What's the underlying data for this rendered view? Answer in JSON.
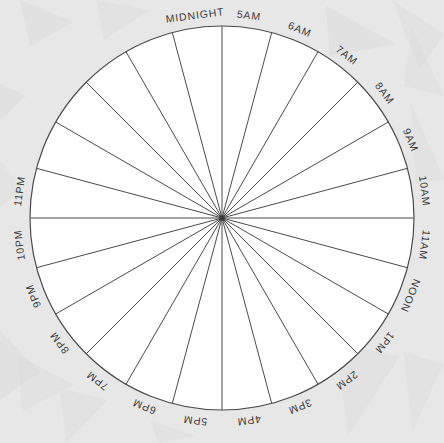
{
  "diagram": {
    "type": "radial-sector-wheel",
    "sector_count": 24,
    "degrees_per_sector": 15,
    "center": {
      "x": 222,
      "y": 218
    },
    "radius": 192,
    "colors": {
      "background": "#e7e7e7",
      "background_shapes": "#dcdcdc",
      "wheel_fill": "#ffffff",
      "stroke": "#4a4a4a",
      "label_text": "#3b3b3b"
    },
    "labels": [
      {
        "text": "MIDNIGHT",
        "angle_deg": -97.5
      },
      {
        "text": "5AM",
        "angle_deg": -82.5
      },
      {
        "text": "6AM",
        "angle_deg": -67.5
      },
      {
        "text": "7AM",
        "angle_deg": -52.5
      },
      {
        "text": "8AM",
        "angle_deg": -37.5
      },
      {
        "text": "9AM",
        "angle_deg": -22.5
      },
      {
        "text": "10AM",
        "angle_deg": -7.5
      },
      {
        "text": "11AM",
        "angle_deg": 7.5
      },
      {
        "text": "NOON",
        "angle_deg": 22.5
      },
      {
        "text": "1PM",
        "angle_deg": 37.5
      },
      {
        "text": "2PM",
        "angle_deg": 52.5
      },
      {
        "text": "3PM",
        "angle_deg": 67.5
      },
      {
        "text": "4PM",
        "angle_deg": 82.5
      },
      {
        "text": "5PM",
        "angle_deg": 97.5
      },
      {
        "text": "6PM",
        "angle_deg": 112.5
      },
      {
        "text": "7PM",
        "angle_deg": 127.5
      },
      {
        "text": "8PM",
        "angle_deg": 142.5
      },
      {
        "text": "9PM",
        "angle_deg": 157.5
      },
      {
        "text": "10PM",
        "angle_deg": 172.5
      },
      {
        "text": "11PM",
        "angle_deg": 187.5
      }
    ],
    "spokes_deg": [
      -90,
      -75,
      -60,
      -45,
      -30,
      -15,
      0,
      15,
      30,
      45,
      60,
      75,
      90,
      105,
      120,
      135,
      150,
      165,
      180,
      195,
      210,
      225,
      240,
      255
    ],
    "background_shapes": [
      {
        "points": "20,0 74,22 30,46",
        "opacity": 0.55
      },
      {
        "points": "96,0 150,10 104,40",
        "opacity": 0.45
      },
      {
        "points": "0,84 26,96 0,120",
        "opacity": 0.5
      },
      {
        "points": "326,6 396,44 330,56",
        "opacity": 0.5
      },
      {
        "points": "392,0 444,34 420,70",
        "opacity": 0.45
      },
      {
        "points": "412,28 444,96 404,86",
        "opacity": 0.4
      },
      {
        "points": "410,100 444,180 416,182",
        "opacity": 0.45
      },
      {
        "points": "0,330 40,372 0,400",
        "opacity": 0.5
      },
      {
        "points": "18,356 74,384 22,412",
        "opacity": 0.45
      },
      {
        "points": "60,388 108,400 66,443",
        "opacity": 0.4
      },
      {
        "points": "282,336 330,352 290,392",
        "opacity": 0.5
      },
      {
        "points": "336,344 400,356 348,436",
        "opacity": 0.45
      },
      {
        "points": "404,352 444,364 412,432",
        "opacity": 0.4
      },
      {
        "points": "150,420 196,436 158,443",
        "opacity": 0.4
      },
      {
        "points": "0,160 22,190 0,208",
        "opacity": 0.35
      }
    ]
  }
}
